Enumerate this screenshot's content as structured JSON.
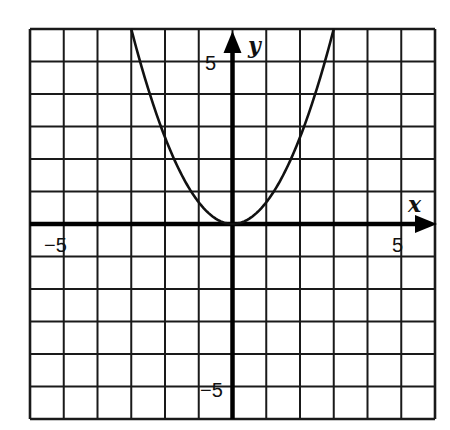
{
  "chart_data": {
    "type": "line",
    "title": "",
    "function": "y = (2/3)x^2",
    "xlabel": "x",
    "ylabel": "y",
    "xlim": [
      -6,
      6
    ],
    "ylim": [
      -6,
      6
    ],
    "grid": true,
    "grid_step": 1,
    "x_tick_labels": [
      {
        "value": -5,
        "label": "−5"
      },
      {
        "value": 5,
        "label": "5"
      }
    ],
    "y_tick_labels": [
      {
        "value": 5,
        "label": "5"
      },
      {
        "value": -5,
        "label": "−5"
      }
    ],
    "series": [
      {
        "name": "parabola",
        "x": [
          -3,
          -2.5,
          -2,
          -1.5,
          -1,
          -0.5,
          0,
          0.5,
          1,
          1.5,
          2,
          2.5,
          3
        ],
        "y": [
          6,
          4.17,
          2.67,
          1.5,
          0.67,
          0.17,
          0,
          0.17,
          0.67,
          1.5,
          2.67,
          4.17,
          6
        ]
      }
    ],
    "colors": {
      "line": "#111111",
      "grid": "#1a1a1a",
      "background": "#ffffff"
    }
  },
  "labels": {
    "x_axis": "x",
    "y_axis": "y",
    "x_neg5": "−5",
    "x_pos5": "5",
    "y_pos5": "5",
    "y_neg5": "−5"
  }
}
